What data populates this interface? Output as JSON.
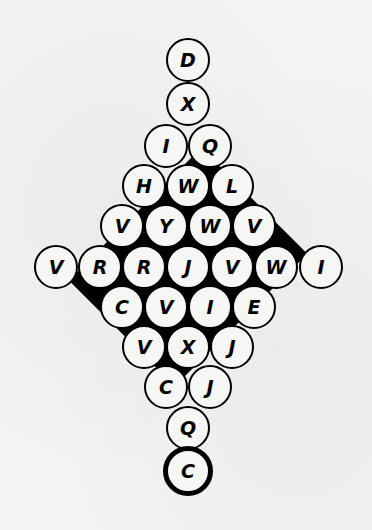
{
  "puzzle": {
    "description": "Diamond-shaped letter circle grid",
    "rows": [
      {
        "y": 60,
        "cells": [
          {
            "x": 188,
            "letter": "D"
          }
        ]
      },
      {
        "y": 104,
        "cells": [
          {
            "x": 188,
            "letter": "X"
          }
        ]
      },
      {
        "y": 146,
        "cells": [
          {
            "x": 166,
            "letter": "I"
          },
          {
            "x": 210,
            "letter": "Q"
          }
        ]
      },
      {
        "y": 186,
        "cells": [
          {
            "x": 144,
            "letter": "H"
          },
          {
            "x": 188,
            "letter": "W"
          },
          {
            "x": 232,
            "letter": "L"
          }
        ]
      },
      {
        "y": 226,
        "cells": [
          {
            "x": 122,
            "letter": "V"
          },
          {
            "x": 166,
            "letter": "Y"
          },
          {
            "x": 210,
            "letter": "W"
          },
          {
            "x": 254,
            "letter": "V"
          }
        ]
      },
      {
        "y": 267,
        "cells": [
          {
            "x": 56,
            "letter": "V"
          },
          {
            "x": 100,
            "letter": "R"
          },
          {
            "x": 144,
            "letter": "R"
          },
          {
            "x": 188,
            "letter": "J"
          },
          {
            "x": 232,
            "letter": "V"
          },
          {
            "x": 276,
            "letter": "W"
          },
          {
            "x": 321,
            "letter": "I"
          }
        ]
      },
      {
        "y": 307,
        "cells": [
          {
            "x": 122,
            "letter": "C"
          },
          {
            "x": 166,
            "letter": "V"
          },
          {
            "x": 210,
            "letter": "I"
          },
          {
            "x": 254,
            "letter": "E"
          }
        ]
      },
      {
        "y": 347,
        "cells": [
          {
            "x": 144,
            "letter": "V"
          },
          {
            "x": 188,
            "letter": "X"
          },
          {
            "x": 232,
            "letter": "J"
          }
        ]
      },
      {
        "y": 387,
        "cells": [
          {
            "x": 166,
            "letter": "C"
          },
          {
            "x": 210,
            "letter": "J"
          }
        ]
      },
      {
        "y": 428,
        "cells": [
          {
            "x": 188,
            "letter": "Q"
          }
        ]
      },
      {
        "y": 471,
        "cells": [
          {
            "x": 188,
            "letter": "C",
            "bold": true
          }
        ]
      }
    ]
  }
}
